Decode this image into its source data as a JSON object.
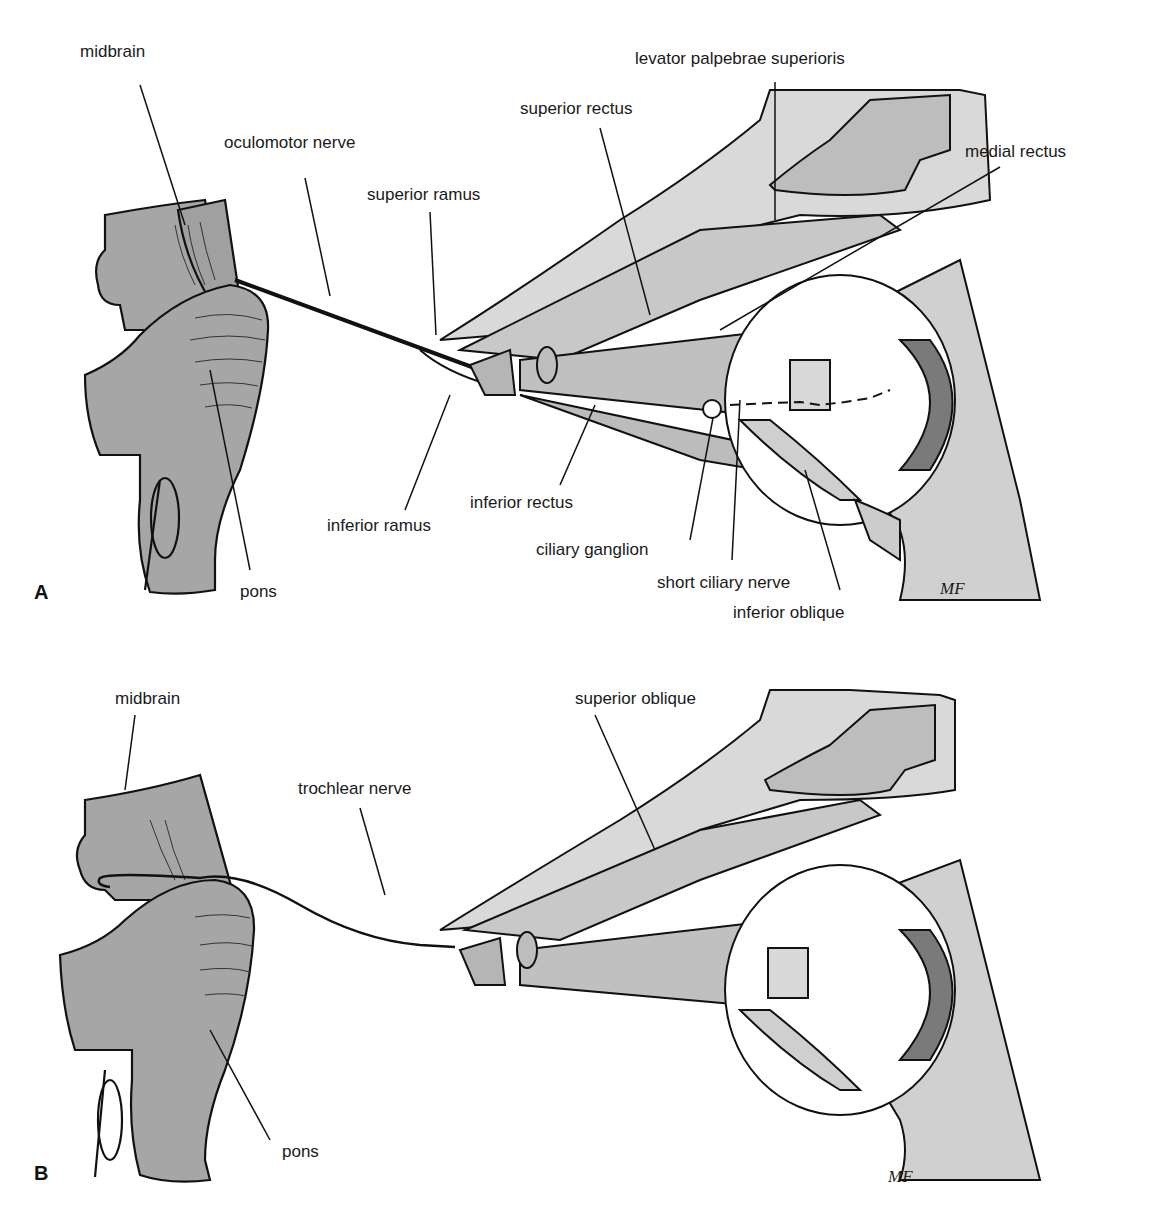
{
  "figure": {
    "colors": {
      "brainstem": "#a6a6a6",
      "muscle": "#c8c8c8",
      "bone": "#d9d9d9",
      "outline": "#111111",
      "background": "#ffffff"
    },
    "panels": [
      {
        "letter": "A",
        "labels": {
          "midbrain": "midbrain",
          "oculomotor_nerve": "oculomotor nerve",
          "superior_ramus": "superior ramus",
          "superior_rectus": "superior rectus",
          "levator": "levator palpebrae superioris",
          "medial_rectus": "medial rectus",
          "inferior_ramus": "inferior ramus",
          "inferior_rectus": "inferior rectus",
          "ciliary_ganglion": "ciliary ganglion",
          "short_ciliary_nerve": "short ciliary nerve",
          "inferior_oblique": "inferior oblique",
          "pons": "pons"
        },
        "signature": "MF"
      },
      {
        "letter": "B",
        "labels": {
          "midbrain": "midbrain",
          "trochlear_nerve": "trochlear nerve",
          "superior_oblique": "superior oblique",
          "pons": "pons"
        },
        "signature": "MF"
      }
    ]
  }
}
